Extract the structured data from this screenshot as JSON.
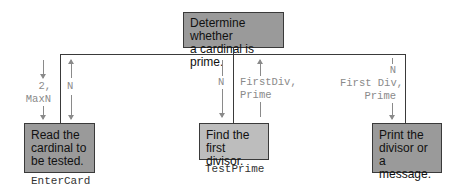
{
  "diagram": {
    "type": "structure-chart",
    "root": {
      "text": "Determine whether a cardinal is prime.",
      "line1": "Determine whether",
      "line2": "a cardinal is prime."
    },
    "modules": [
      {
        "line1": "Read the",
        "line2": "cardinal to",
        "line3": "be tested.",
        "name": "EnterCard",
        "params_down": "2,\nMaxN",
        "params_up": "N"
      },
      {
        "line1": "Find the",
        "line2": "first divisor.",
        "name": "TestPrime",
        "params_down": "N",
        "params_up": "FirstDiv,\nPrime"
      },
      {
        "line1": "Print the",
        "line2": "divisor or",
        "line3": "a message.",
        "name": "",
        "params_down": "N\nFirst Div,\nPrime"
      }
    ]
  }
}
